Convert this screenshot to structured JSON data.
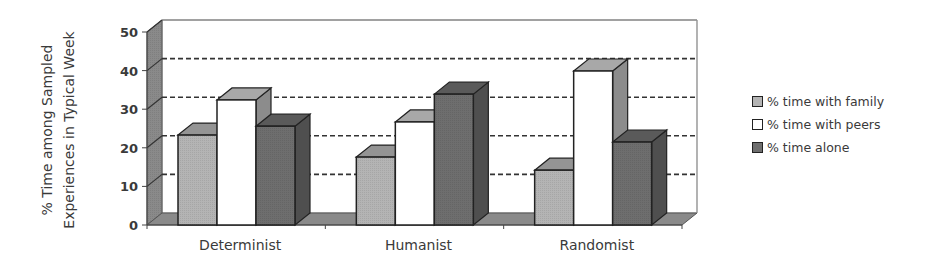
{
  "chart_data": {
    "type": "bar",
    "style": "3d-clustered-column",
    "title": "",
    "xlabel": "",
    "ylabel_lines": [
      "% Time among Sampled",
      "Experiences in Typical Week"
    ],
    "ylabel": "% Time among Sampled Experiences in Typical Week",
    "ylim": [
      0,
      50
    ],
    "yticks": [
      0,
      10,
      20,
      30,
      40,
      50
    ],
    "grid": "dashed horizontal on back wall",
    "legend_position": "right",
    "categories": [
      "Determinist",
      "Humanist",
      "Randomist"
    ],
    "series": [
      {
        "name": "% time with family",
        "color": "#b4b4b4",
        "values": [
          23.3,
          17.6,
          14.2
        ]
      },
      {
        "name": "% time with peers",
        "color": "#ffffff",
        "values": [
          32.4,
          26.7,
          39.9
        ]
      },
      {
        "name": "% time alone",
        "color": "#6e6e6e",
        "values": [
          25.6,
          33.9,
          21.5
        ]
      }
    ]
  }
}
